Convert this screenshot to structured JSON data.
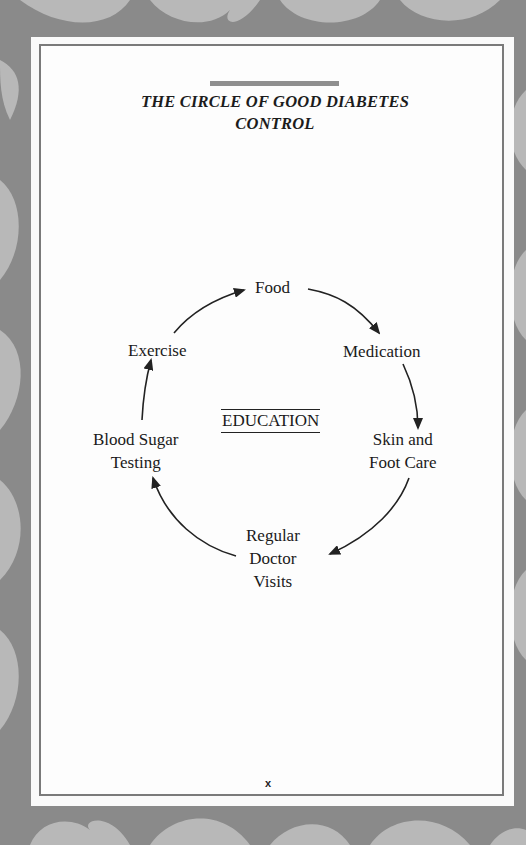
{
  "page": {
    "title_line1": "THE CIRCLE OF GOOD DIABETES",
    "title_line2": "CONTROL",
    "page_number": "x"
  },
  "diagram": {
    "center_label": "EDUCATION",
    "nodes": [
      {
        "id": "food",
        "lines": [
          "Food"
        ]
      },
      {
        "id": "medication",
        "lines": [
          "Medication"
        ]
      },
      {
        "id": "skin-foot-care",
        "lines": [
          "Skin and",
          "Foot Care"
        ]
      },
      {
        "id": "doctor-visits",
        "lines": [
          "Regular",
          "Doctor",
          "Visits"
        ]
      },
      {
        "id": "blood-sugar-testing",
        "lines": [
          "Blood Sugar",
          "Testing"
        ]
      },
      {
        "id": "exercise",
        "lines": [
          "Exercise"
        ]
      }
    ],
    "edges": [
      {
        "from": "food",
        "to": "medication"
      },
      {
        "from": "medication",
        "to": "skin-foot-care"
      },
      {
        "from": "skin-foot-care",
        "to": "doctor-visits"
      },
      {
        "from": "doctor-visits",
        "to": "blood-sugar-testing"
      },
      {
        "from": "blood-sugar-testing",
        "to": "exercise"
      },
      {
        "from": "exercise",
        "to": "food"
      }
    ],
    "flow_direction": "clockwise"
  },
  "colors": {
    "frame_bg": "#8a8a8a",
    "ornament": "#b8b8b8",
    "page_bg": "#fdfdfd",
    "rule": "#8f8f8f",
    "text": "#1a1a1a"
  }
}
